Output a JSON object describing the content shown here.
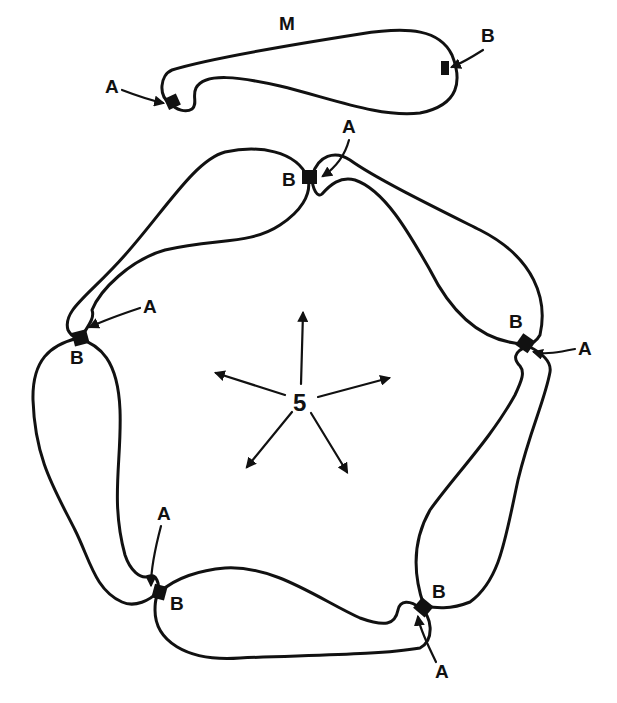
{
  "diagram": {
    "monomer": {
      "label": "M",
      "site_a_label": "A",
      "site_b_label": "B"
    },
    "ring": {
      "center_label": "5",
      "arrow_count": 5,
      "junctions": [
        {
          "position": "top",
          "a_label": "A",
          "b_label": "B"
        },
        {
          "position": "right",
          "a_label": "A",
          "b_label": "B"
        },
        {
          "position": "bottom-right",
          "a_label": "A",
          "b_label": "B"
        },
        {
          "position": "bottom-left",
          "a_label": "A",
          "b_label": "B"
        },
        {
          "position": "left",
          "a_label": "A",
          "b_label": "B"
        }
      ]
    },
    "colors": {
      "stroke": "#111111",
      "background": "#ffffff"
    }
  }
}
